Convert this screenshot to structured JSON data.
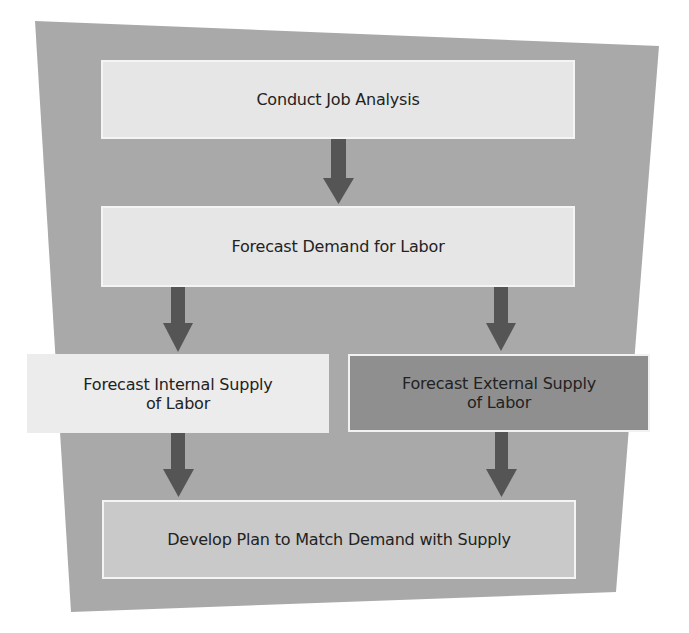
{
  "diagram": {
    "type": "flowchart",
    "colors": {
      "backdrop": "#a9a9a9",
      "arrow": "#555555",
      "box_light": "#e6e6e6",
      "box_internal": "#ececec",
      "box_external": "#8f8f8f",
      "box_final": "#c9c9c9",
      "text": "#222222"
    },
    "nodes": [
      {
        "id": "job-analysis",
        "label": "Conduct Job Analysis"
      },
      {
        "id": "forecast-demand",
        "label": "Forecast Demand for Labor"
      },
      {
        "id": "forecast-internal",
        "label": "Forecast Internal Supply\nof Labor"
      },
      {
        "id": "forecast-external",
        "label": "Forecast External Supply\nof Labor"
      },
      {
        "id": "develop-plan",
        "label": "Develop Plan to Match Demand with Supply"
      }
    ],
    "edges": [
      {
        "from": "job-analysis",
        "to": "forecast-demand"
      },
      {
        "from": "forecast-demand",
        "to": "forecast-internal"
      },
      {
        "from": "forecast-demand",
        "to": "forecast-external"
      },
      {
        "from": "forecast-internal",
        "to": "develop-plan"
      },
      {
        "from": "forecast-external",
        "to": "develop-plan"
      }
    ]
  }
}
